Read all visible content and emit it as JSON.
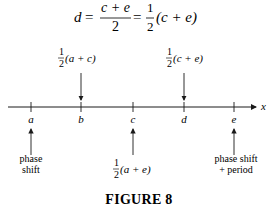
{
  "equation": {
    "lhs": "d",
    "eq": "=",
    "frac1_num": "c + e",
    "frac1_den": "2",
    "eq2": "=",
    "frac2_num": "1",
    "frac2_den": "2",
    "tail": "(c + e)"
  },
  "axis": {
    "label": "x",
    "ticks": [
      {
        "id": "a",
        "label": "a",
        "x": 31
      },
      {
        "id": "b",
        "label": "b",
        "x": 81
      },
      {
        "id": "c",
        "label": "c",
        "x": 133
      },
      {
        "id": "d",
        "label": "d",
        "x": 184
      },
      {
        "id": "e",
        "label": "e",
        "x": 234
      }
    ]
  },
  "annotations": {
    "above_b": {
      "num": "1",
      "den": "2",
      "expr": "(a + c)"
    },
    "above_d": {
      "num": "1",
      "den": "2",
      "expr": "(c + e)"
    },
    "below_a": {
      "line1": "phase",
      "line2": "shift"
    },
    "below_c": {
      "num": "1",
      "den": "2",
      "expr": "(a + e)"
    },
    "below_e": {
      "line1": "phase shift",
      "line2": "+ period"
    }
  },
  "caption": "FIGURE 8",
  "colors": {
    "ink": "#1a1a1a",
    "background": "#ffffff"
  }
}
